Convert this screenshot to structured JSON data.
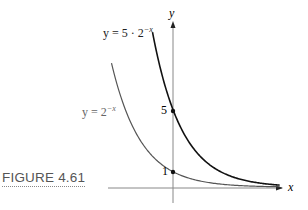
{
  "figure": {
    "caption": "FIGURE 4.61"
  },
  "chart_data": {
    "type": "line",
    "title": "",
    "xlabel": "x",
    "ylabel": "y",
    "series": [
      {
        "name": "y = 5 · 2^{-x}",
        "label_text": "y = 5 · 2",
        "label_exp": "−x",
        "color": "#111111",
        "x": [
          -1.0,
          -0.5,
          0,
          0.5,
          1,
          2,
          3,
          4,
          5
        ],
        "values": [
          10,
          7.07,
          5,
          3.54,
          2.5,
          1.25,
          0.625,
          0.3125,
          0.156
        ]
      },
      {
        "name": "y = 2^{-x}",
        "label_text": "y = 2",
        "label_exp": "−x",
        "color": "#555555",
        "x": [
          -3,
          -2,
          -1,
          0,
          1,
          2,
          3,
          4,
          5
        ],
        "values": [
          8,
          4,
          2,
          1,
          0.5,
          0.25,
          0.125,
          0.0625,
          0.031
        ]
      }
    ],
    "annotations": [
      {
        "label": "5",
        "x": 0,
        "y": 5
      },
      {
        "label": "1",
        "x": 0,
        "y": 1
      }
    ],
    "xlim": [
      -4.5,
      6.5
    ],
    "ylim": [
      -1.5,
      12
    ],
    "grid": false,
    "legend": "inline labels"
  }
}
